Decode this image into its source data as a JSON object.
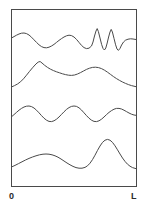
{
  "figure": {
    "title": "",
    "background_color": "#ffffff",
    "frame": {
      "name": "plot-frame",
      "x": 11.5,
      "y": 9.5,
      "width": 125,
      "height": 177,
      "stroke_color": "#4a4a4a",
      "stroke_width": 1,
      "fill": "none"
    },
    "axis": {
      "x_start_label": "0",
      "x_end_label": "L",
      "label_color": "#2b2b2b"
    }
  },
  "chart_data": {
    "type": "line",
    "title": "",
    "xlabel": "",
    "ylabel": "",
    "xlim": [
      0,
      1
    ],
    "ylim": [
      0,
      1
    ],
    "grid": false,
    "legend": null,
    "x_tick_labels": [
      "0",
      "L"
    ],
    "y_tick_labels": [],
    "series": [
      {
        "name": "curve-1-top",
        "stroke_color": "#4a4a4a",
        "stroke_width": 1,
        "points": [
          [
            11.5,
            38.0
          ],
          [
            14.0,
            36.6
          ],
          [
            16.5,
            35.2
          ],
          [
            19.0,
            34.0
          ],
          [
            21.5,
            33.2
          ],
          [
            24.0,
            33.0
          ],
          [
            26.5,
            33.6
          ],
          [
            29.0,
            35.0
          ],
          [
            31.5,
            37.2
          ],
          [
            34.0,
            39.8
          ],
          [
            36.5,
            42.4
          ],
          [
            39.0,
            44.8
          ],
          [
            41.5,
            46.6
          ],
          [
            44.0,
            47.6
          ],
          [
            46.5,
            47.8
          ],
          [
            49.0,
            47.2
          ],
          [
            51.5,
            46.0
          ],
          [
            54.0,
            44.4
          ],
          [
            56.5,
            42.4
          ],
          [
            59.0,
            40.4
          ],
          [
            61.5,
            38.6
          ],
          [
            64.0,
            37.0
          ],
          [
            66.5,
            35.8
          ],
          [
            69.0,
            35.2
          ],
          [
            71.5,
            35.6
          ],
          [
            74.0,
            37.0
          ],
          [
            76.5,
            39.4
          ],
          [
            79.0,
            42.4
          ],
          [
            81.5,
            45.4
          ],
          [
            84.0,
            47.6
          ],
          [
            86.5,
            48.6
          ],
          [
            89.0,
            48.2
          ],
          [
            91.5,
            46.0
          ],
          [
            93.0,
            42.0
          ],
          [
            94.5,
            36.0
          ],
          [
            96.0,
            31.0
          ],
          [
            97.2,
            28.6
          ],
          [
            98.4,
            31.6
          ],
          [
            100.0,
            38.0
          ],
          [
            101.6,
            44.4
          ],
          [
            103.0,
            48.4
          ],
          [
            104.4,
            50.0
          ],
          [
            105.8,
            48.0
          ],
          [
            107.2,
            43.0
          ],
          [
            108.6,
            37.0
          ],
          [
            110.0,
            32.0
          ],
          [
            111.2,
            29.4
          ],
          [
            112.4,
            32.0
          ],
          [
            114.0,
            38.4
          ],
          [
            115.6,
            44.8
          ],
          [
            117.0,
            49.0
          ],
          [
            118.4,
            50.4
          ],
          [
            120.0,
            48.4
          ],
          [
            121.6,
            45.0
          ],
          [
            123.5,
            42.0
          ],
          [
            125.5,
            40.2
          ],
          [
            128.0,
            39.2
          ],
          [
            130.5,
            38.8
          ],
          [
            133.0,
            39.0
          ],
          [
            136.5,
            39.6
          ]
        ]
      },
      {
        "name": "curve-2",
        "stroke_color": "#4a4a4a",
        "stroke_width": 1,
        "points": [
          [
            11.5,
            87.0
          ],
          [
            14.5,
            85.6
          ],
          [
            17.5,
            84.0
          ],
          [
            20.5,
            81.8
          ],
          [
            23.5,
            78.8
          ],
          [
            26.5,
            75.2
          ],
          [
            29.5,
            71.4
          ],
          [
            32.5,
            67.8
          ],
          [
            35.0,
            65.0
          ],
          [
            37.0,
            63.0
          ],
          [
            38.8,
            61.8
          ],
          [
            40.2,
            61.6
          ],
          [
            42.0,
            63.0
          ],
          [
            44.5,
            65.2
          ],
          [
            47.5,
            67.4
          ],
          [
            50.5,
            69.2
          ],
          [
            53.5,
            70.6
          ],
          [
            56.5,
            71.8
          ],
          [
            59.5,
            72.8
          ],
          [
            62.5,
            73.8
          ],
          [
            65.5,
            74.6
          ],
          [
            68.5,
            75.2
          ],
          [
            71.5,
            75.4
          ],
          [
            74.5,
            75.0
          ],
          [
            77.5,
            74.0
          ],
          [
            80.5,
            72.6
          ],
          [
            83.5,
            71.0
          ],
          [
            86.5,
            69.4
          ],
          [
            89.5,
            68.2
          ],
          [
            92.5,
            67.4
          ],
          [
            95.5,
            67.2
          ],
          [
            98.5,
            67.6
          ],
          [
            101.5,
            68.6
          ],
          [
            104.5,
            70.2
          ],
          [
            107.5,
            72.2
          ],
          [
            110.5,
            74.4
          ],
          [
            113.5,
            76.6
          ],
          [
            116.5,
            78.6
          ],
          [
            119.5,
            80.4
          ],
          [
            122.5,
            82.0
          ],
          [
            125.5,
            83.4
          ],
          [
            128.5,
            84.6
          ],
          [
            131.5,
            85.6
          ],
          [
            136.5,
            86.8
          ]
        ]
      },
      {
        "name": "curve-3",
        "stroke_color": "#4a4a4a",
        "stroke_width": 1,
        "points": [
          [
            11.5,
            116.8
          ],
          [
            14.0,
            114.6
          ],
          [
            16.5,
            112.4
          ],
          [
            19.0,
            110.2
          ],
          [
            21.5,
            108.4
          ],
          [
            24.0,
            107.0
          ],
          [
            26.5,
            106.2
          ],
          [
            29.0,
            106.0
          ],
          [
            31.5,
            106.6
          ],
          [
            34.0,
            108.0
          ],
          [
            36.5,
            110.2
          ],
          [
            39.0,
            112.8
          ],
          [
            41.5,
            115.6
          ],
          [
            44.0,
            118.2
          ],
          [
            46.5,
            120.2
          ],
          [
            49.0,
            121.4
          ],
          [
            51.5,
            121.6
          ],
          [
            54.0,
            120.8
          ],
          [
            56.5,
            119.2
          ],
          [
            59.0,
            117.0
          ],
          [
            61.5,
            114.4
          ],
          [
            64.0,
            111.8
          ],
          [
            66.5,
            109.4
          ],
          [
            69.0,
            107.6
          ],
          [
            71.5,
            106.4
          ],
          [
            74.0,
            106.0
          ],
          [
            76.5,
            106.4
          ],
          [
            79.0,
            107.8
          ],
          [
            81.5,
            110.0
          ],
          [
            84.0,
            112.8
          ],
          [
            86.5,
            115.6
          ],
          [
            89.0,
            118.2
          ],
          [
            91.5,
            120.2
          ],
          [
            94.0,
            121.4
          ],
          [
            96.5,
            121.6
          ],
          [
            99.0,
            120.8
          ],
          [
            101.5,
            119.2
          ],
          [
            104.0,
            117.0
          ],
          [
            106.5,
            114.6
          ],
          [
            109.0,
            112.4
          ],
          [
            111.5,
            110.6
          ],
          [
            114.0,
            109.2
          ],
          [
            116.5,
            108.4
          ],
          [
            119.0,
            108.4
          ],
          [
            121.5,
            109.0
          ],
          [
            124.0,
            110.2
          ],
          [
            126.5,
            111.6
          ],
          [
            129.0,
            113.0
          ],
          [
            131.5,
            114.2
          ],
          [
            134.0,
            115.0
          ],
          [
            136.5,
            115.4
          ]
        ]
      },
      {
        "name": "curve-4-bottom",
        "stroke_color": "#4a4a4a",
        "stroke_width": 1,
        "points": [
          [
            11.5,
            167.0
          ],
          [
            15.0,
            165.4
          ],
          [
            18.5,
            163.6
          ],
          [
            22.0,
            161.8
          ],
          [
            25.5,
            160.0
          ],
          [
            29.0,
            158.4
          ],
          [
            32.5,
            157.0
          ],
          [
            36.0,
            155.8
          ],
          [
            39.5,
            154.8
          ],
          [
            43.0,
            154.2
          ],
          [
            46.0,
            154.0
          ],
          [
            49.0,
            154.2
          ],
          [
            52.0,
            154.8
          ],
          [
            55.0,
            155.8
          ],
          [
            58.0,
            157.2
          ],
          [
            61.0,
            159.0
          ],
          [
            64.0,
            161.0
          ],
          [
            67.0,
            163.0
          ],
          [
            70.0,
            164.8
          ],
          [
            73.0,
            166.4
          ],
          [
            76.0,
            167.6
          ],
          [
            79.0,
            168.2
          ],
          [
            82.0,
            168.2
          ],
          [
            85.0,
            167.4
          ],
          [
            87.5,
            165.8
          ],
          [
            90.0,
            163.2
          ],
          [
            92.5,
            159.6
          ],
          [
            95.0,
            155.2
          ],
          [
            97.5,
            150.4
          ],
          [
            100.0,
            146.0
          ],
          [
            102.5,
            142.4
          ],
          [
            105.0,
            140.2
          ],
          [
            107.5,
            139.4
          ],
          [
            110.0,
            140.2
          ],
          [
            112.5,
            142.4
          ],
          [
            115.0,
            145.8
          ],
          [
            117.5,
            149.8
          ],
          [
            120.0,
            154.0
          ],
          [
            122.5,
            158.0
          ],
          [
            125.0,
            161.4
          ],
          [
            127.5,
            164.2
          ],
          [
            130.0,
            166.2
          ],
          [
            132.5,
            167.6
          ],
          [
            136.5,
            168.8
          ]
        ]
      }
    ]
  }
}
